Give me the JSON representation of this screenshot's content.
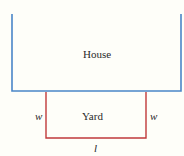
{
  "diagram": {
    "colors": {
      "house": "#4a86c8",
      "yard": "#c0393b",
      "text": "#2a2a2a",
      "background": "#fefef9"
    },
    "house": {
      "label": "House"
    },
    "yard": {
      "label": "Yard",
      "width_left_label": "w",
      "width_right_label": "w",
      "length_label": "l"
    }
  }
}
